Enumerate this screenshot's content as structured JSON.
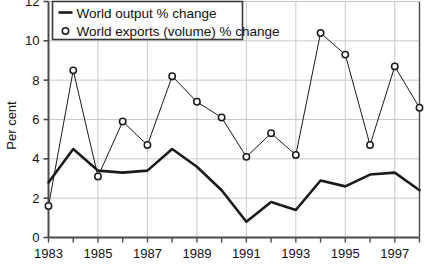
{
  "chart_data": {
    "type": "line",
    "title": "",
    "xlabel": "",
    "ylabel": "Per cent",
    "xlim": [
      1983,
      1998
    ],
    "ylim": [
      0,
      12
    ],
    "grid": true,
    "legend_position": "top-left",
    "x": [
      1983,
      1984,
      1985,
      1986,
      1987,
      1988,
      1989,
      1990,
      1991,
      1992,
      1993,
      1994,
      1995,
      1996,
      1997,
      1998
    ],
    "x_tick_labels": [
      "1983",
      "1985",
      "1987",
      "1989",
      "1991",
      "1993",
      "1995",
      "1997"
    ],
    "x_tick_values": [
      1983,
      1985,
      1987,
      1989,
      1991,
      1993,
      1995,
      1997
    ],
    "y_tick_labels": [
      "0",
      "2",
      "4",
      "6",
      "8",
      "10",
      "12"
    ],
    "y_tick_values": [
      0,
      2,
      4,
      6,
      8,
      10,
      12
    ],
    "series": [
      {
        "name": "World output % change",
        "marker": "none",
        "line_width": 2.6,
        "color": "#1a1a1a",
        "values": [
          2.8,
          4.5,
          3.4,
          3.3,
          3.4,
          4.5,
          3.6,
          2.4,
          0.8,
          1.8,
          1.4,
          2.9,
          2.6,
          3.2,
          3.3,
          2.4
        ]
      },
      {
        "name": "World exports (volume) % change",
        "marker": "circle",
        "line_width": 1.0,
        "color": "#1a1a1a",
        "values": [
          1.6,
          8.5,
          3.1,
          5.9,
          4.7,
          8.2,
          6.9,
          6.1,
          4.1,
          5.3,
          4.2,
          10.4,
          9.3,
          4.7,
          8.7,
          6.6
        ]
      }
    ]
  },
  "legend": {
    "items": [
      {
        "label": "World output % change",
        "symbol": "line"
      },
      {
        "label": "World exports (volume) % change",
        "symbol": "circle"
      }
    ]
  },
  "axes": {
    "y_title": "Per cent"
  },
  "colors": {
    "ink": "#1a1a1a",
    "grid": "#c8c8c8",
    "frame": "#4a4a4a",
    "background": "#ffffff"
  }
}
